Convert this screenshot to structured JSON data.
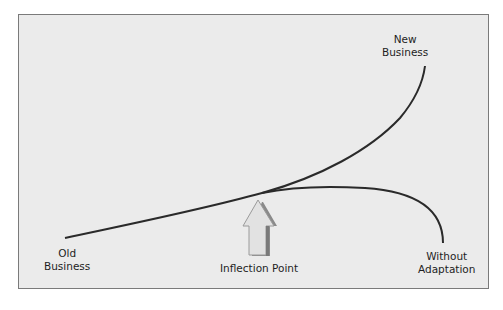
{
  "diagram": {
    "type": "curve-diagram",
    "labels": {
      "old_business": [
        "Old",
        "Business"
      ],
      "new_business": [
        "New",
        "Business"
      ],
      "inflection_point": "Inflection Point",
      "without_adaptation": [
        "Without",
        "Adaptation"
      ]
    },
    "colors": {
      "background": "#ebebeb",
      "border": "#7a7a7a",
      "curve": "#2a2a2a",
      "arrow_fill": "#e2e2e2",
      "arrow_shadow": "#8a8a8a"
    },
    "curves": [
      {
        "name": "old-to-new-business",
        "from": "Old Business",
        "through": "Inflection Point",
        "to": "New Business"
      },
      {
        "name": "without-adaptation",
        "from": "Inflection Point",
        "to": "Without Adaptation"
      }
    ]
  }
}
